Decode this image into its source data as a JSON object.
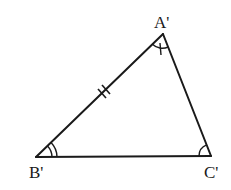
{
  "diagram": {
    "type": "triangle",
    "stroke_color": "#1a1a1a",
    "background": "#ffffff",
    "vertices": {
      "A": {
        "label": "A'",
        "x": 163,
        "y": 34
      },
      "B": {
        "label": "B'",
        "x": 36,
        "y": 157
      },
      "C": {
        "label": "C'",
        "x": 211,
        "y": 156
      }
    },
    "markings": {
      "side_AB": "double tick (equal side mark)",
      "angle_A": "single arc with single tick",
      "angle_B": "double arc",
      "angle_C": "single arc"
    }
  }
}
